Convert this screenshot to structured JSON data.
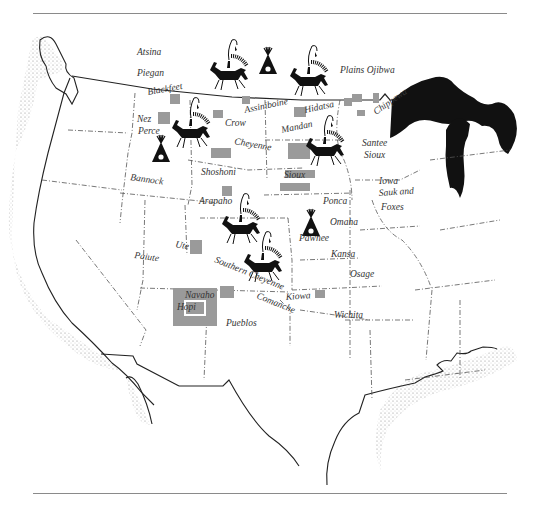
{
  "map": {
    "subject": "Plains Indian tribes of North America",
    "colors": {
      "background": "#ffffff",
      "ink": "#111111",
      "territory_fill": "#9a9a9a",
      "coast_stipple": "#bdbdbd",
      "rule": "#8a8a8a"
    },
    "icons": [
      {
        "name": "horse-rider-icon",
        "x": 228,
        "y": 62
      },
      {
        "name": "tipi-icon",
        "x": 268,
        "y": 60
      },
      {
        "name": "horse-rider-icon",
        "x": 307,
        "y": 68
      },
      {
        "name": "horse-rider-icon",
        "x": 190,
        "y": 130
      },
      {
        "name": "tipi-icon",
        "x": 161,
        "y": 148
      },
      {
        "name": "horse-rider-icon",
        "x": 322,
        "y": 140
      },
      {
        "name": "tipi-icon",
        "x": 311,
        "y": 220
      },
      {
        "name": "horse-rider-icon",
        "x": 240,
        "y": 220
      },
      {
        "name": "horse-rider-icon",
        "x": 262,
        "y": 262
      }
    ],
    "labels": [
      {
        "text": "Atsina",
        "x": 137,
        "y": 55,
        "rotate": 0
      },
      {
        "text": "Piegan",
        "x": 137,
        "y": 76,
        "rotate": 0
      },
      {
        "text": "Plains Ojibwa",
        "x": 340,
        "y": 73,
        "rotate": 0
      },
      {
        "text": "Blackfeet",
        "x": 148,
        "y": 95,
        "rotate": -10
      },
      {
        "text": "Assiniboine",
        "x": 245,
        "y": 113,
        "rotate": -12
      },
      {
        "text": "Hidatsa",
        "x": 305,
        "y": 113,
        "rotate": -12
      },
      {
        "text": "Chippewa",
        "x": 376,
        "y": 115,
        "rotate": -35
      },
      {
        "text": "Crow",
        "x": 225,
        "y": 126,
        "rotate": 0
      },
      {
        "text": "Nez",
        "x": 137,
        "y": 122,
        "rotate": 0
      },
      {
        "text": "Perce",
        "x": 138,
        "y": 134,
        "rotate": 0
      },
      {
        "text": "Mandan",
        "x": 282,
        "y": 133,
        "rotate": -12
      },
      {
        "text": "Cheyenne",
        "x": 234,
        "y": 144,
        "rotate": 10
      },
      {
        "text": "Santee",
        "x": 362,
        "y": 146,
        "rotate": 0
      },
      {
        "text": "Sioux",
        "x": 364,
        "y": 158,
        "rotate": 0
      },
      {
        "text": "Bannock",
        "x": 130,
        "y": 180,
        "rotate": 8
      },
      {
        "text": "Shoshoni",
        "x": 201,
        "y": 175,
        "rotate": 0
      },
      {
        "text": "Sioux",
        "x": 284,
        "y": 178,
        "rotate": 0
      },
      {
        "text": "Iowa",
        "x": 379,
        "y": 184,
        "rotate": 0
      },
      {
        "text": "Sauk and",
        "x": 379,
        "y": 196,
        "rotate": -4
      },
      {
        "text": "Foxes",
        "x": 381,
        "y": 210,
        "rotate": 0
      },
      {
        "text": "Arapaho",
        "x": 199,
        "y": 204,
        "rotate": 0
      },
      {
        "text": "Ponca",
        "x": 323,
        "y": 204,
        "rotate": 0
      },
      {
        "text": "Omaha",
        "x": 330,
        "y": 225,
        "rotate": 0
      },
      {
        "text": "Pawnee",
        "x": 299,
        "y": 241,
        "rotate": 0
      },
      {
        "text": "Kansa",
        "x": 331,
        "y": 257,
        "rotate": 0
      },
      {
        "text": "Ute",
        "x": 175,
        "y": 247,
        "rotate": 10
      },
      {
        "text": "Paiute",
        "x": 134,
        "y": 258,
        "rotate": 8
      },
      {
        "text": "Southern Cheyenne",
        "x": 214,
        "y": 262,
        "rotate": 22
      },
      {
        "text": "Osage",
        "x": 350,
        "y": 277,
        "rotate": 0
      },
      {
        "text": "Navaho",
        "x": 185,
        "y": 298,
        "rotate": 0
      },
      {
        "text": "Hopi",
        "x": 177,
        "y": 310,
        "rotate": 0
      },
      {
        "text": "Comanche",
        "x": 256,
        "y": 298,
        "rotate": 22
      },
      {
        "text": "Kiowa",
        "x": 286,
        "y": 300,
        "rotate": -4
      },
      {
        "text": "Pueblos",
        "x": 226,
        "y": 326,
        "rotate": 0
      },
      {
        "text": "Wichita",
        "x": 334,
        "y": 318,
        "rotate": 0
      }
    ]
  }
}
